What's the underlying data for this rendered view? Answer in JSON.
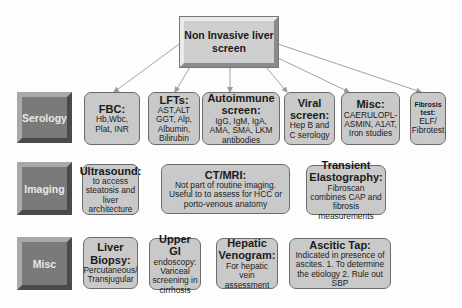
{
  "root": {
    "title": "Non Invasive liver screen"
  },
  "rows": [
    {
      "label": "Serology",
      "items": [
        {
          "title": "FBC:",
          "detail": "Hb,Wbc, Plat, INR"
        },
        {
          "title": "LFTs:",
          "detail": "AST,ALT GGT, Alp, Albumin, Bilirubin"
        },
        {
          "title": "Autoimmune screen:",
          "detail": "IgG, IgM, IgA, AMA, SMA, LKM antibodies"
        },
        {
          "title": "Viral screen:",
          "detail": "Hep B and C serology"
        },
        {
          "title": "Misc:",
          "detail": "CAERULOPL-ASMIN, A1AT, Iron studies"
        },
        {
          "title": "Fibrosis test:",
          "detail": "ELF/ Fibrotest"
        }
      ]
    },
    {
      "label": "Imaging",
      "items": [
        {
          "title": "Ultrasound:",
          "detail": "to access steatosis and liver architecture"
        },
        {
          "title": "CT/MRI:",
          "detail": "Not part of routine imaging. Useful to to assess for HCC or porto-venous anatomy"
        },
        {
          "title": "Transient Elastography:",
          "detail": "Fibroscan combines CAP and fibrosis measurements"
        }
      ]
    },
    {
      "label": "Misc",
      "items": [
        {
          "title": "Liver Biopsy:",
          "detail": "Percutaneous/ Transjugular"
        },
        {
          "title": "Upper GI",
          "detail": "endoscopy: Variceal screening in cirrhosis"
        },
        {
          "title": "Hepatic Venogram:",
          "detail": "For hepatic vein assessment"
        },
        {
          "title": "Ascitic Tap:",
          "detail": "Indicated in presence of ascites. 1. To determine the etiology 2. Rule out SBP"
        }
      ]
    }
  ],
  "colors": {
    "box_fill": "#c9c9c9",
    "label_fill": "#7a7a7a",
    "arrow": "#9a9a9a"
  }
}
